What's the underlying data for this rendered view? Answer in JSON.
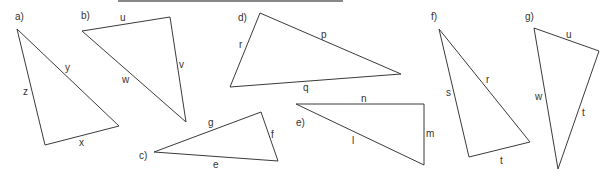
{
  "stroke_color": "#3a3a3a",
  "rule_color": "#888888",
  "triangles": [
    {
      "label": "a)",
      "label_pos": [
        15,
        20
      ],
      "vertices": [
        [
          17,
          29
        ],
        [
          45,
          145
        ],
        [
          119,
          126
        ]
      ],
      "sides": [
        {
          "text": "z",
          "pos": [
            23,
            95
          ]
        },
        {
          "text": "y",
          "pos": [
            65,
            71
          ]
        },
        {
          "text": "x",
          "pos": [
            79,
            146
          ]
        }
      ]
    },
    {
      "label": "b)",
      "label_pos": [
        81,
        19
      ],
      "vertices": [
        [
          82,
          31
        ],
        [
          170,
          17
        ],
        [
          186,
          122
        ]
      ],
      "sides": [
        {
          "text": "u",
          "pos": [
            120,
            21
          ]
        },
        {
          "text": "v",
          "pos": [
            179,
            68
          ]
        },
        {
          "text": "w",
          "pos": [
            122,
            83
          ]
        }
      ]
    },
    {
      "label": "c)",
      "label_pos": [
        139,
        159
      ],
      "vertices": [
        [
          154,
          152
        ],
        [
          261,
          112
        ],
        [
          278,
          161
        ]
      ],
      "sides": [
        {
          "text": "g",
          "pos": [
            208,
            126
          ]
        },
        {
          "text": "f",
          "pos": [
            271,
            138
          ]
        },
        {
          "text": "e",
          "pos": [
            213,
            168
          ]
        }
      ]
    },
    {
      "label": "d)",
      "label_pos": [
        238,
        21
      ],
      "vertices": [
        [
          260,
          13
        ],
        [
          230,
          87
        ],
        [
          401,
          74
        ]
      ],
      "sides": [
        {
          "text": "r",
          "pos": [
            239,
            48
          ]
        },
        {
          "text": "p",
          "pos": [
            321,
            38
          ]
        },
        {
          "text": "q",
          "pos": [
            303,
            91
          ]
        }
      ]
    },
    {
      "label": "e)",
      "label_pos": [
        296,
        126
      ],
      "vertices": [
        [
          296,
          104
        ],
        [
          424,
          104
        ],
        [
          424,
          165
        ]
      ],
      "sides": [
        {
          "text": "n",
          "pos": [
            361,
            102
          ]
        },
        {
          "text": "l",
          "pos": [
            352,
            144
          ]
        },
        {
          "text": "m",
          "pos": [
            426,
            137
          ]
        }
      ]
    },
    {
      "label": "f)",
      "label_pos": [
        431,
        20
      ],
      "vertices": [
        [
          439,
          29
        ],
        [
          469,
          157
        ],
        [
          530,
          142
        ]
      ],
      "sides": [
        {
          "text": "s",
          "pos": [
            446,
            96
          ]
        },
        {
          "text": "r",
          "pos": [
            486,
            83
          ]
        },
        {
          "text": "t",
          "pos": [
            500,
            164
          ]
        }
      ]
    },
    {
      "label": "g)",
      "label_pos": [
        525,
        20
      ],
      "vertices": [
        [
          534,
          28
        ],
        [
          599,
          51
        ],
        [
          558,
          169
        ]
      ],
      "sides": [
        {
          "text": "u",
          "pos": [
            566,
            38
          ]
        },
        {
          "text": "w",
          "pos": [
            535,
            100
          ]
        },
        {
          "text": "t",
          "pos": [
            582,
            116
          ]
        }
      ]
    }
  ]
}
